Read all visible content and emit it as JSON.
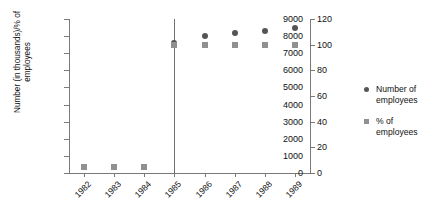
{
  "chart_data": {
    "type": "scatter",
    "title": "",
    "xlabel": "",
    "ylabel": "Number (in thousands)/% of\nemployees",
    "ylabel_right": "",
    "categories": [
      "1982",
      "1983",
      "1984",
      "1985",
      "1986",
      "1987",
      "1988",
      "1989"
    ],
    "ylim": [
      0,
      9000
    ],
    "yticks": [
      0,
      1000,
      2000,
      3000,
      4000,
      5000,
      6000,
      7000,
      8000,
      9000
    ],
    "ylim_right": [
      0,
      120
    ],
    "yticks_right": [
      0,
      20,
      40,
      60,
      80,
      100,
      120
    ],
    "grid": false,
    "legend_position": "right",
    "series": [
      {
        "name": "Number of\nemployees",
        "marker": "circle",
        "color": "#555555",
        "axis": "left",
        "values": [
          null,
          null,
          null,
          7600,
          8000,
          8200,
          8300,
          8500
        ]
      },
      {
        "name": "% of\nemployees",
        "marker": "square",
        "color": "#909090",
        "axis": "right",
        "values": [
          5,
          5,
          5,
          100,
          100,
          100,
          100,
          100
        ]
      }
    ],
    "annotations": [
      {
        "type": "vertical-line",
        "x": "1985",
        "color": "#6f6f6f"
      }
    ]
  },
  "axis": {
    "left_ticks": [
      "9000",
      "8000",
      "7000",
      "6000",
      "5000",
      "4000",
      "3000",
      "2000",
      "1000",
      "0"
    ],
    "right_ticks": [
      "120",
      "100",
      "80",
      "60",
      "40",
      "20",
      "0"
    ],
    "x_ticks": [
      "1982",
      "1983",
      "1984",
      "1985",
      "1986",
      "1987",
      "1988",
      "1989"
    ],
    "y_title_line1": "Number (in thousands)/% of",
    "y_title_line2": "employees"
  },
  "legend": {
    "items": [
      {
        "label": "Number of\nemployees",
        "marker": "circle",
        "color": "#555555"
      },
      {
        "label": "% of\nemployees",
        "marker": "square",
        "color": "#909090"
      }
    ]
  },
  "colors": {
    "series_number": "#555555",
    "series_percent": "#909090",
    "axis": "#7a7a7a",
    "background": "#ffffff"
  }
}
